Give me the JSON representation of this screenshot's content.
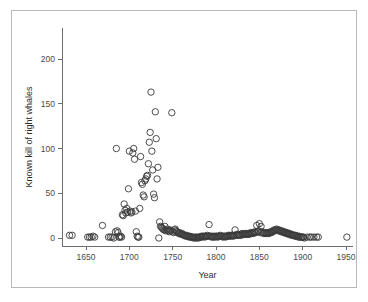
{
  "figure": {
    "background": "#ffffff",
    "frame_color": "#b9b9b9",
    "axis_color": "#6d6d6d",
    "marker_color": "#3a3a3a"
  },
  "chart_data": {
    "type": "scatter",
    "title": "",
    "xlabel": "Year",
    "ylabel": "Known kill of right whales",
    "xlim": [
      1625,
      1960
    ],
    "ylim": [
      -8,
      230
    ],
    "xticks": [
      1650,
      1700,
      1750,
      1800,
      1850,
      1900,
      1950
    ],
    "xticklabels": [
      "1650",
      "1700",
      "1750",
      "1800",
      "1850",
      "1900",
      "1950"
    ],
    "yticks": [
      0,
      50,
      100,
      150,
      200
    ],
    "yticklabels": [
      "0",
      "50",
      "100",
      "150",
      "200"
    ],
    "grid": false,
    "legend": null,
    "marker": "open-circle",
    "marker_size": 3.2,
    "series": [
      {
        "name": "Known kill of right whales",
        "points": [
          [
            1631,
            3
          ],
          [
            1634,
            3
          ],
          [
            1652,
            1
          ],
          [
            1654,
            1
          ],
          [
            1656,
            1
          ],
          [
            1658,
            2
          ],
          [
            1660,
            1
          ],
          [
            1669,
            14
          ],
          [
            1676,
            1
          ],
          [
            1678,
            1
          ],
          [
            1680,
            1
          ],
          [
            1682,
            0
          ],
          [
            1684,
            7
          ],
          [
            1685,
            100
          ],
          [
            1686,
            8
          ],
          [
            1687,
            6
          ],
          [
            1688,
            1
          ],
          [
            1689,
            1
          ],
          [
            1690,
            2
          ],
          [
            1691,
            1
          ],
          [
            1692,
            26
          ],
          [
            1693,
            25
          ],
          [
            1694,
            38
          ],
          [
            1695,
            31
          ],
          [
            1696,
            28
          ],
          [
            1697,
            33
          ],
          [
            1698,
            29
          ],
          [
            1699,
            55
          ],
          [
            1700,
            97
          ],
          [
            1701,
            30
          ],
          [
            1702,
            28
          ],
          [
            1703,
            29
          ],
          [
            1704,
            95
          ],
          [
            1705,
            100
          ],
          [
            1706,
            88
          ],
          [
            1707,
            30
          ],
          [
            1708,
            7
          ],
          [
            1709,
            2
          ],
          [
            1710,
            1
          ],
          [
            1711,
            1
          ],
          [
            1712,
            33
          ],
          [
            1713,
            91
          ],
          [
            1714,
            62
          ],
          [
            1715,
            60
          ],
          [
            1716,
            48
          ],
          [
            1717,
            46
          ],
          [
            1718,
            64
          ],
          [
            1719,
            66
          ],
          [
            1720,
            69
          ],
          [
            1721,
            70
          ],
          [
            1722,
            83
          ],
          [
            1723,
            107
          ],
          [
            1724,
            118
          ],
          [
            1725,
            163
          ],
          [
            1726,
            97
          ],
          [
            1727,
            76
          ],
          [
            1728,
            49
          ],
          [
            1729,
            45
          ],
          [
            1730,
            141
          ],
          [
            1731,
            111
          ],
          [
            1732,
            66
          ],
          [
            1733,
            79
          ],
          [
            1734,
            0
          ],
          [
            1735,
            18
          ],
          [
            1736,
            13
          ],
          [
            1737,
            12
          ],
          [
            1738,
            11
          ],
          [
            1739,
            10
          ],
          [
            1740,
            9
          ],
          [
            1741,
            13
          ],
          [
            1742,
            8
          ],
          [
            1743,
            9
          ],
          [
            1744,
            10
          ],
          [
            1745,
            8
          ],
          [
            1746,
            7
          ],
          [
            1747,
            9
          ],
          [
            1748,
            8
          ],
          [
            1749,
            140
          ],
          [
            1750,
            7
          ],
          [
            1751,
            6
          ],
          [
            1752,
            9
          ],
          [
            1753,
            10
          ],
          [
            1754,
            8
          ],
          [
            1755,
            7
          ],
          [
            1756,
            6
          ],
          [
            1757,
            5
          ],
          [
            1758,
            6
          ],
          [
            1759,
            5
          ],
          [
            1760,
            4
          ],
          [
            1761,
            5
          ],
          [
            1762,
            4
          ],
          [
            1763,
            3
          ],
          [
            1764,
            3
          ],
          [
            1765,
            2
          ],
          [
            1766,
            3
          ],
          [
            1767,
            2
          ],
          [
            1768,
            2
          ],
          [
            1769,
            1
          ],
          [
            1770,
            2
          ],
          [
            1771,
            1
          ],
          [
            1772,
            1
          ],
          [
            1773,
            1
          ],
          [
            1774,
            0
          ],
          [
            1775,
            1
          ],
          [
            1776,
            0
          ],
          [
            1777,
            1
          ],
          [
            1778,
            0
          ],
          [
            1779,
            1
          ],
          [
            1780,
            0
          ],
          [
            1781,
            1
          ],
          [
            1782,
            1
          ],
          [
            1783,
            2
          ],
          [
            1784,
            1
          ],
          [
            1785,
            2
          ],
          [
            1786,
            2
          ],
          [
            1787,
            1
          ],
          [
            1788,
            2
          ],
          [
            1789,
            2
          ],
          [
            1790,
            3
          ],
          [
            1791,
            2
          ],
          [
            1792,
            15
          ],
          [
            1793,
            2
          ],
          [
            1794,
            2
          ],
          [
            1795,
            1
          ],
          [
            1796,
            2
          ],
          [
            1797,
            1
          ],
          [
            1798,
            2
          ],
          [
            1799,
            1
          ],
          [
            1800,
            2
          ],
          [
            1801,
            2
          ],
          [
            1802,
            1
          ],
          [
            1803,
            2
          ],
          [
            1804,
            2
          ],
          [
            1805,
            3
          ],
          [
            1806,
            2
          ],
          [
            1807,
            2
          ],
          [
            1808,
            1
          ],
          [
            1809,
            2
          ],
          [
            1810,
            2
          ],
          [
            1811,
            1
          ],
          [
            1812,
            2
          ],
          [
            1813,
            2
          ],
          [
            1814,
            3
          ],
          [
            1815,
            2
          ],
          [
            1816,
            3
          ],
          [
            1817,
            2
          ],
          [
            1818,
            3
          ],
          [
            1819,
            3
          ],
          [
            1820,
            2
          ],
          [
            1821,
            3
          ],
          [
            1822,
            9
          ],
          [
            1823,
            3
          ],
          [
            1824,
            4
          ],
          [
            1825,
            3
          ],
          [
            1826,
            4
          ],
          [
            1827,
            3
          ],
          [
            1828,
            4
          ],
          [
            1829,
            3
          ],
          [
            1830,
            5
          ],
          [
            1831,
            4
          ],
          [
            1832,
            4
          ],
          [
            1833,
            5
          ],
          [
            1834,
            4
          ],
          [
            1835,
            5
          ],
          [
            1836,
            4
          ],
          [
            1837,
            5
          ],
          [
            1838,
            4
          ],
          [
            1839,
            5
          ],
          [
            1840,
            6
          ],
          [
            1841,
            5
          ],
          [
            1842,
            6
          ],
          [
            1843,
            5
          ],
          [
            1844,
            6
          ],
          [
            1845,
            7
          ],
          [
            1846,
            6
          ],
          [
            1847,
            14
          ],
          [
            1848,
            7
          ],
          [
            1849,
            8
          ],
          [
            1850,
            16
          ],
          [
            1851,
            6
          ],
          [
            1852,
            13
          ],
          [
            1853,
            7
          ],
          [
            1854,
            6
          ],
          [
            1855,
            5
          ],
          [
            1856,
            6
          ],
          [
            1857,
            5
          ],
          [
            1858,
            6
          ],
          [
            1859,
            5
          ],
          [
            1860,
            6
          ],
          [
            1861,
            5
          ],
          [
            1862,
            6
          ],
          [
            1863,
            7
          ],
          [
            1864,
            6
          ],
          [
            1865,
            7
          ],
          [
            1866,
            8
          ],
          [
            1867,
            9
          ],
          [
            1868,
            8
          ],
          [
            1869,
            9
          ],
          [
            1870,
            10
          ],
          [
            1871,
            9
          ],
          [
            1872,
            8
          ],
          [
            1873,
            9
          ],
          [
            1874,
            8
          ],
          [
            1875,
            7
          ],
          [
            1876,
            8
          ],
          [
            1877,
            7
          ],
          [
            1878,
            6
          ],
          [
            1879,
            7
          ],
          [
            1880,
            6
          ],
          [
            1881,
            5
          ],
          [
            1882,
            6
          ],
          [
            1883,
            5
          ],
          [
            1884,
            4
          ],
          [
            1885,
            5
          ],
          [
            1886,
            4
          ],
          [
            1887,
            3
          ],
          [
            1888,
            4
          ],
          [
            1889,
            3
          ],
          [
            1890,
            3
          ],
          [
            1891,
            2
          ],
          [
            1892,
            3
          ],
          [
            1893,
            2
          ],
          [
            1894,
            2
          ],
          [
            1895,
            1
          ],
          [
            1896,
            2
          ],
          [
            1897,
            1
          ],
          [
            1898,
            1
          ],
          [
            1899,
            1
          ],
          [
            1900,
            1
          ],
          [
            1901,
            1
          ],
          [
            1902,
            0
          ],
          [
            1905,
            1
          ],
          [
            1908,
            1
          ],
          [
            1910,
            1
          ],
          [
            1913,
            1
          ],
          [
            1916,
            1
          ],
          [
            1918,
            1
          ],
          [
            1951,
            1
          ]
        ]
      }
    ]
  }
}
